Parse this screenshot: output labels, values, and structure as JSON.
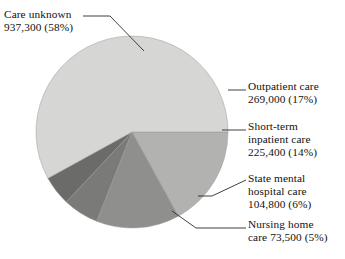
{
  "figure": {
    "background": "#ffffff",
    "text_color": "#111111"
  },
  "chart_data": {
    "type": "pie",
    "title": "",
    "subtitle": "",
    "xlabel": "",
    "ylabel": "",
    "legend_position": "callout-labels",
    "grid": false,
    "total": 1610000,
    "units": "people",
    "start_angle_deg": 0,
    "direction": "clockwise",
    "categories": [
      "Care unknown",
      "Outpatient care",
      "Short-term inpatient care",
      "State mental hospital care",
      "Nursing home care"
    ],
    "values": [
      937300,
      269000,
      225400,
      104800,
      73500
    ],
    "percents": [
      58,
      17,
      14,
      6,
      5
    ],
    "value_labels": [
      "937,300",
      "269,000",
      "225,400",
      "104,800",
      "73,500"
    ],
    "percent_labels": [
      "(58%)",
      "(17%)",
      "(14%)",
      "(6%)",
      "(5%)"
    ],
    "colors": [
      "#d6d6d4",
      "#b2b2b0",
      "#8f8f8d",
      "#7a7a78",
      "#6b6b69"
    ],
    "slice_edge_color": "#9a9a98",
    "slices": [
      {
        "name": "Care unknown",
        "value": 937300,
        "percent": 58,
        "color": "#d6d6d4",
        "start_deg": 42,
        "end_deg": 360
      },
      {
        "name": "Outpatient care",
        "value": 269000,
        "percent": 17,
        "color": "#b2b2b0",
        "start_deg": 0,
        "end_deg": -61.2
      },
      {
        "name": "Short-term inpatient care",
        "value": 225400,
        "percent": 14,
        "color": "#8f8f8d",
        "start_deg": -61.2,
        "end_deg": -111.6
      },
      {
        "name": "State mental hospital care",
        "value": 104800,
        "percent": 6,
        "color": "#7a7a78",
        "start_deg": -111.6,
        "end_deg": -133.2
      },
      {
        "name": "Nursing home care",
        "value": 73500,
        "percent": 5,
        "color": "#6b6b69",
        "start_deg": -133.2,
        "end_deg": -151.2
      }
    ],
    "geometry": {
      "center_x": 132,
      "center_y": 132,
      "radius": 96
    }
  },
  "labels": {
    "care_unknown": "Care unknown\n937,300 (58%)",
    "outpatient": "Outpatient care\n269,000 (17%)",
    "short_term": "Short-term\ninpatient care\n225,400 (14%)",
    "state_mental": "State mental\nhospital care\n104,800 (6%)",
    "nursing_home": "Nursing home\ncare 73,500 (5%)"
  }
}
